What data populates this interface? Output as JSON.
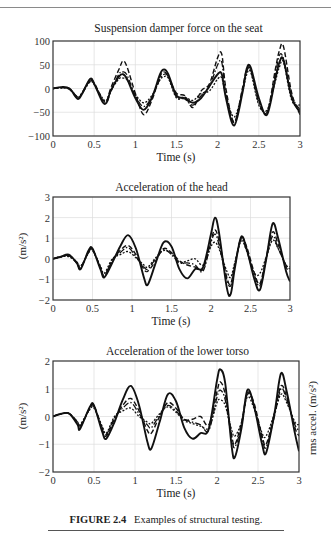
{
  "figure": {
    "caption_label": "FIGURE 2.4",
    "caption_text": "Examples of structural testing."
  },
  "chart_data": [
    {
      "type": "line",
      "title": "Suspension damper force on the seat",
      "xlabel": "Time (s)",
      "ylabel": "",
      "xlim": [
        0,
        3
      ],
      "ylim": [
        -100,
        100
      ],
      "xticks": [
        "0",
        "0.5",
        "1",
        "1.5",
        "2",
        "2.5",
        "3"
      ],
      "yticks": [
        "100",
        "50",
        "0",
        "−50",
        "−100"
      ],
      "ytick_values": [
        100,
        50,
        0,
        -50,
        -100
      ],
      "grid": true,
      "legend": null,
      "x": [
        0,
        0.1,
        0.2,
        0.3,
        0.35,
        0.45,
        0.5,
        0.6,
        0.65,
        0.7,
        0.8,
        0.85,
        0.9,
        1.0,
        1.1,
        1.2,
        1.3,
        1.35,
        1.4,
        1.5,
        1.6,
        1.7,
        1.8,
        1.9,
        2.0,
        2.05,
        2.1,
        2.2,
        2.3,
        2.35,
        2.4,
        2.5,
        2.6,
        2.7,
        2.75,
        2.8,
        2.9,
        3.0
      ],
      "series": [
        {
          "name": "solid",
          "style": "solid",
          "values": [
            0,
            3,
            0,
            -22,
            -12,
            20,
            10,
            -28,
            -30,
            -5,
            25,
            30,
            20,
            -20,
            -45,
            -20,
            30,
            40,
            30,
            -15,
            -20,
            -30,
            -20,
            5,
            30,
            30,
            -20,
            -78,
            -10,
            40,
            45,
            -20,
            -55,
            20,
            55,
            60,
            -20,
            -50
          ]
        },
        {
          "name": "dashed",
          "style": "dashed",
          "values": [
            0,
            2,
            -2,
            -20,
            -10,
            18,
            12,
            -22,
            -28,
            0,
            40,
            58,
            45,
            -10,
            -55,
            -25,
            25,
            35,
            25,
            -10,
            -15,
            -40,
            -5,
            10,
            65,
            72,
            0,
            -70,
            0,
            38,
            40,
            -25,
            -50,
            40,
            80,
            88,
            -10,
            -55
          ]
        },
        {
          "name": "dash-dot",
          "style": "dashdot",
          "values": [
            0,
            2,
            -1,
            -18,
            -12,
            15,
            10,
            -25,
            -30,
            -8,
            30,
            35,
            28,
            -15,
            -38,
            -18,
            20,
            30,
            25,
            -18,
            -22,
            -35,
            -15,
            5,
            50,
            55,
            -10,
            -72,
            -5,
            35,
            38,
            -30,
            -50,
            30,
            70,
            62,
            -15,
            -45
          ]
        },
        {
          "name": "dotted",
          "style": "dotted",
          "values": [
            0,
            1,
            0,
            -18,
            -10,
            14,
            8,
            -20,
            -25,
            -5,
            20,
            22,
            18,
            -12,
            -30,
            -15,
            18,
            25,
            22,
            -20,
            -18,
            -25,
            -10,
            -5,
            20,
            22,
            -15,
            -60,
            -8,
            28,
            35,
            -35,
            -45,
            15,
            45,
            55,
            -25,
            -35
          ]
        }
      ]
    },
    {
      "type": "line",
      "title": "Acceleration of the head",
      "xlabel": "Time (s)",
      "ylabel": "(m/s²)",
      "xlim": [
        0,
        3
      ],
      "ylim": [
        -2,
        3
      ],
      "xticks": [
        "0",
        "0.5",
        "1",
        "1.5",
        "2",
        "2.5",
        "3"
      ],
      "yticks": [
        "3",
        "2",
        "1",
        "0",
        "−1",
        "−2"
      ],
      "ytick_values": [
        3,
        2,
        1,
        0,
        -1,
        -2
      ],
      "grid": true,
      "legend": null,
      "x": [
        0,
        0.1,
        0.2,
        0.3,
        0.35,
        0.45,
        0.5,
        0.6,
        0.65,
        0.75,
        0.85,
        0.95,
        1.05,
        1.15,
        1.2,
        1.3,
        1.4,
        1.5,
        1.6,
        1.7,
        1.8,
        1.9,
        2.0,
        2.05,
        2.1,
        2.2,
        2.25,
        2.3,
        2.38,
        2.45,
        2.55,
        2.62,
        2.7,
        2.78,
        2.85,
        2.95,
        3.0
      ],
      "series": [
        {
          "name": "solid",
          "style": "solid",
          "values": [
            0,
            0.1,
            0.2,
            -0.2,
            -0.5,
            0.4,
            0.5,
            -0.5,
            -0.9,
            -0.2,
            0.6,
            1.15,
            0.5,
            -0.9,
            -1.25,
            -0.2,
            0.8,
            0.6,
            -0.5,
            -0.95,
            -0.5,
            -0.4,
            1.2,
            2.0,
            1.3,
            -1.4,
            -1.7,
            -0.5,
            1.05,
            0.5,
            -1.0,
            -1.5,
            0.0,
            1.7,
            1.0,
            -0.6,
            -1.1
          ]
        },
        {
          "name": "dashed",
          "style": "dashed",
          "values": [
            0,
            0.1,
            0.15,
            -0.2,
            -0.45,
            0.35,
            0.45,
            -0.4,
            -0.8,
            -0.1,
            0.4,
            0.65,
            0.2,
            -0.5,
            -0.6,
            -0.1,
            0.5,
            0.3,
            -0.1,
            -0.3,
            -0.4,
            -0.5,
            0.9,
            1.4,
            0.9,
            -0.9,
            -1.2,
            -0.3,
            1.0,
            0.6,
            -0.7,
            -1.2,
            0.1,
            1.3,
            0.7,
            -0.4,
            -0.6
          ]
        },
        {
          "name": "dash-dot",
          "style": "dashdot",
          "values": [
            0,
            0.1,
            0.15,
            -0.15,
            -0.4,
            0.3,
            0.45,
            -0.45,
            -0.85,
            -0.05,
            0.3,
            0.55,
            0.1,
            -0.4,
            -0.5,
            0.0,
            0.45,
            0.2,
            -0.2,
            -0.2,
            -0.3,
            -0.6,
            0.8,
            1.2,
            0.7,
            -1.0,
            -1.3,
            -0.4,
            0.95,
            0.4,
            -0.8,
            -1.3,
            0.0,
            1.1,
            0.5,
            -0.3,
            -0.5
          ]
        },
        {
          "name": "dotted",
          "style": "dotted",
          "values": [
            0,
            0.1,
            0.1,
            -0.15,
            -0.35,
            0.3,
            0.4,
            -0.35,
            -0.7,
            0.0,
            0.2,
            0.35,
            0.05,
            -0.3,
            -0.4,
            0.05,
            0.4,
            0.25,
            -0.15,
            -0.1,
            0.0,
            -0.3,
            0.6,
            0.8,
            0.5,
            -0.6,
            -0.9,
            -0.2,
            0.85,
            0.4,
            -0.7,
            -0.7,
            0.1,
            0.9,
            0.5,
            -0.3,
            -0.4
          ]
        }
      ]
    },
    {
      "type": "line",
      "title": "Acceleration of the lower torso",
      "xlabel": "Time (s)",
      "ylabel": "(m/s²)",
      "ylabel_right": "rms accel. (m/s²)",
      "xlim": [
        0,
        3
      ],
      "ylim": [
        -2,
        2
      ],
      "xticks": [
        "0",
        "0.5",
        "1",
        "1.5",
        "2",
        "2.5",
        "3"
      ],
      "yticks": [
        "2",
        "1",
        "0",
        "−1",
        "−2"
      ],
      "ytick_values": [
        2,
        1,
        0,
        -1,
        -2
      ],
      "grid": true,
      "legend": null,
      "x": [
        0,
        0.1,
        0.2,
        0.3,
        0.33,
        0.45,
        0.5,
        0.6,
        0.65,
        0.75,
        0.85,
        0.95,
        1.05,
        1.15,
        1.2,
        1.3,
        1.4,
        1.5,
        1.6,
        1.7,
        1.8,
        1.9,
        2.0,
        2.04,
        2.1,
        2.18,
        2.22,
        2.3,
        2.37,
        2.45,
        2.55,
        2.6,
        2.7,
        2.78,
        2.85,
        2.95,
        3.0
      ],
      "series": [
        {
          "name": "solid",
          "style": "solid",
          "values": [
            0,
            0.1,
            0.1,
            -0.3,
            -0.45,
            0.35,
            0.4,
            -0.55,
            -0.8,
            -0.2,
            0.6,
            1.1,
            0.4,
            -0.9,
            -1.15,
            -0.2,
            0.8,
            0.55,
            -0.4,
            -0.8,
            -0.6,
            -0.45,
            1.3,
            1.7,
            1.2,
            -1.1,
            -1.45,
            -0.4,
            0.95,
            0.4,
            -1.0,
            -1.3,
            0.1,
            1.55,
            0.9,
            -0.6,
            -1.25
          ]
        },
        {
          "name": "dashed",
          "style": "dashed",
          "values": [
            0,
            0.1,
            0.1,
            -0.25,
            -0.4,
            0.3,
            0.4,
            -0.45,
            -0.7,
            -0.1,
            0.4,
            0.65,
            0.2,
            -0.5,
            -0.6,
            0.0,
            0.5,
            0.3,
            -0.1,
            -0.1,
            0.0,
            -0.3,
            0.9,
            1.25,
            0.8,
            -0.7,
            -1.0,
            -0.2,
            0.85,
            0.5,
            -0.7,
            -1.0,
            0.1,
            1.1,
            0.7,
            -0.4,
            -0.7
          ]
        },
        {
          "name": "dash-dot",
          "style": "dashdot",
          "values": [
            0,
            0.1,
            0.1,
            -0.2,
            -0.35,
            0.3,
            0.35,
            -0.4,
            -0.65,
            -0.05,
            0.3,
            0.5,
            0.1,
            -0.3,
            -0.4,
            0.05,
            0.4,
            0.2,
            -0.1,
            -0.2,
            -0.3,
            -0.5,
            0.7,
            0.95,
            0.6,
            -0.8,
            -1.1,
            -0.3,
            0.8,
            0.4,
            -0.8,
            -1.1,
            0.0,
            1.0,
            0.6,
            -0.3,
            -0.5
          ]
        },
        {
          "name": "dotted",
          "style": "dotted",
          "values": [
            0,
            0.1,
            0.1,
            -0.2,
            -0.3,
            0.25,
            0.3,
            -0.35,
            -0.6,
            0.0,
            0.2,
            0.3,
            0.0,
            -0.2,
            -0.25,
            0.1,
            0.35,
            0.15,
            -0.15,
            -0.25,
            -0.35,
            -0.4,
            0.5,
            0.6,
            0.4,
            -0.5,
            -0.7,
            -0.2,
            0.7,
            0.3,
            -0.6,
            -0.7,
            0.1,
            0.8,
            0.5,
            -0.2,
            -0.3
          ]
        }
      ]
    }
  ]
}
